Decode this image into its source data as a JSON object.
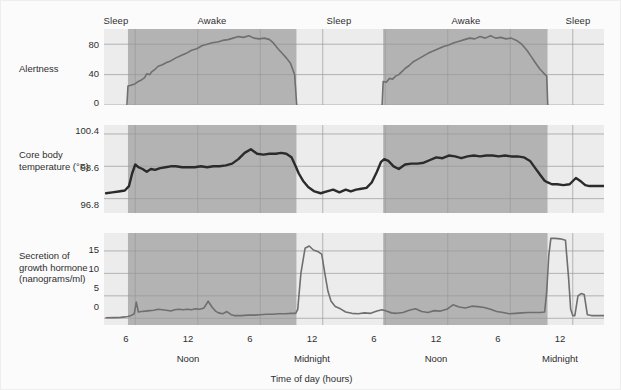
{
  "figure": {
    "background_color": "#fbfbfb",
    "border_color": "#eeeeee",
    "awake_band_color": "#b3b3b3",
    "sleep_band_color": "#ececec",
    "grid_color": "#9a9a9a",
    "line_color": "#6f6f6f",
    "temp_line_color": "#2b2b2b",
    "text_color": "#2f2f2f"
  },
  "band_labels": [
    {
      "text": "Sleep",
      "center_x": 115
    },
    {
      "text": "Awake",
      "center_x": 211
    },
    {
      "text": "Awake",
      "center_x": 465
    },
    {
      "text": "Sleep",
      "center_x": 338
    },
    {
      "text": "Sleep",
      "center_x": 577
    }
  ],
  "axis": {
    "x_title": "Time of day (hours)",
    "x_ticks": [
      {
        "label": "6",
        "x": 125
      },
      {
        "label": "12",
        "x": 187
      },
      {
        "label": "6",
        "x": 249
      },
      {
        "label": "12",
        "x": 311
      },
      {
        "label": "6",
        "x": 373
      },
      {
        "label": "12",
        "x": 435
      },
      {
        "label": "6",
        "x": 497
      },
      {
        "label": "12",
        "x": 559
      }
    ],
    "x_sublabels": [
      {
        "label": "Noon",
        "x": 187
      },
      {
        "label": "Midnight",
        "x": 311
      },
      {
        "label": "Noon",
        "x": 435
      },
      {
        "label": "Midnight",
        "x": 559
      }
    ]
  },
  "panels": [
    {
      "id": "alertness",
      "label": "Alertness",
      "label_lines": [
        "Alertness"
      ],
      "y_ticks": [
        "80",
        "40",
        "0"
      ]
    },
    {
      "id": "core-body-temperature",
      "label": "Core body temperature (°F)",
      "label_lines": [
        "Core body",
        "temperature (°F)"
      ],
      "y_ticks": [
        "100.4",
        "98.6",
        "96.8"
      ]
    },
    {
      "id": "growth-hormone",
      "label": "Secretion of growth hormone (nanograms/ml)",
      "label_lines": [
        "Secretion of",
        "growth hormone",
        "(nanograms/ml)"
      ],
      "y_ticks": [
        "15",
        "10",
        "5",
        "0"
      ]
    }
  ],
  "chart_data": {
    "type": "line",
    "title": "",
    "xlabel": "Time of day (hours)",
    "grid": true,
    "legend": "none",
    "x_axis": {
      "unit": "hours from start",
      "range": [
        3,
        51
      ],
      "tick_values": [
        6,
        12,
        18,
        24,
        30,
        36,
        42,
        48
      ],
      "tick_labels": [
        "6",
        "12",
        "6",
        "12",
        "6",
        "12",
        "6",
        "12"
      ],
      "tick_sublabels": [
        "",
        "Noon",
        "",
        "Midnight",
        "",
        "Noon",
        "",
        "Midnight"
      ]
    },
    "shaded_regions": [
      {
        "state": "Sleep",
        "x_start": 3,
        "x_end": 5.3,
        "color": "#ececec"
      },
      {
        "state": "Awake",
        "x_start": 5.3,
        "x_end": 21.5,
        "color": "#b3b3b3"
      },
      {
        "state": "Sleep",
        "x_start": 21.5,
        "x_end": 29.8,
        "color": "#ececec"
      },
      {
        "state": "Awake",
        "x_start": 29.8,
        "x_end": 45.6,
        "color": "#b3b3b3"
      },
      {
        "state": "Sleep",
        "x_start": 45.6,
        "x_end": 51,
        "color": "#ececec"
      }
    ],
    "panels": [
      {
        "id": "alertness",
        "ylabel": "Alertness",
        "ylim": [
          0,
          100
        ],
        "ytick_values": [
          0,
          40,
          80
        ],
        "ytick_labels": [
          "0",
          "40",
          "80"
        ],
        "line_color": "#6f6f6f",
        "series": [
          {
            "name": "Alertness",
            "segments": [
              {
                "x": [
                  5.2,
                  5.3,
                  5.6,
                  6.0,
                  6.3,
                  6.6,
                  6.9,
                  7.1,
                  7.4,
                  7.6,
                  7.9,
                  8.2,
                  8.6,
                  9.0,
                  9.4,
                  9.9,
                  10.4,
                  10.9,
                  11.4,
                  11.9,
                  12.4,
                  12.9,
                  13.4,
                  13.9,
                  14.4,
                  14.9,
                  15.4,
                  15.9,
                  16.4,
                  16.9,
                  17.4,
                  17.9,
                  18.4,
                  18.9,
                  19.3,
                  19.7,
                  20.1,
                  20.5,
                  20.9,
                  21.3,
                  21.5
                ],
                "y": [
                  0,
                  25,
                  26,
                  28,
                  31,
                  33,
                  36,
                  41,
                  40,
                  44,
                  47,
                  51,
                  53,
                  56,
                  58,
                  62,
                  65,
                  68,
                  72,
                  74,
                  78,
                  80,
                  82,
                  83,
                  85,
                  86,
                  88,
                  90,
                  89,
                  91,
                  88,
                  87,
                  88,
                  86,
                  81,
                  74,
                  68,
                  62,
                  55,
                  40,
                  0
                ]
              }
            ]
          },
          {
            "name": "Alertness (day 2)",
            "segments": [
              {
                "x": [
                  29.7,
                  29.8,
                  30.1,
                  30.4,
                  30.7,
                  31.0,
                  31.3,
                  31.6,
                  31.9,
                  32.3,
                  32.7,
                  33.1,
                  33.6,
                  34.1,
                  34.6,
                  35.1,
                  35.6,
                  36.1,
                  36.6,
                  37.1,
                  37.6,
                  38.1,
                  38.6,
                  39.1,
                  39.6,
                  40.1,
                  40.6,
                  41.1,
                  41.6,
                  42.1,
                  42.6,
                  43.1,
                  43.6,
                  44.0,
                  44.4,
                  44.8,
                  45.2,
                  45.5,
                  45.6
                ],
                "y": [
                  0,
                  31,
                  30,
                  35,
                  34,
                  38,
                  40,
                  44,
                  48,
                  52,
                  57,
                  60,
                  64,
                  68,
                  71,
                  74,
                  77,
                  79,
                  82,
                  84,
                  86,
                  88,
                  87,
                  90,
                  88,
                  91,
                  88,
                  89,
                  87,
                  88,
                  85,
                  80,
                  72,
                  64,
                  56,
                  48,
                  42,
                  38,
                  0
                ]
              }
            ]
          }
        ]
      },
      {
        "id": "core-body-temperature",
        "ylabel": "Core body temperature (°F)",
        "ylim": [
          96.0,
          100.9
        ],
        "ytick_values": [
          96.8,
          98.6,
          100.4
        ],
        "ytick_labels": [
          "96.8",
          "98.6",
          "100.4"
        ],
        "line_color": "#2b2b2b",
        "series": [
          {
            "name": "Core body temperature",
            "segments": [
              {
                "x": [
                  3.2,
                  3.8,
                  4.4,
                  5.0,
                  5.4,
                  5.7,
                  6.0,
                  6.3,
                  6.7,
                  7.1,
                  7.5,
                  7.9,
                  8.4,
                  8.9,
                  9.4,
                  9.9,
                  10.5,
                  11.1,
                  11.7,
                  12.3,
                  12.9,
                  13.5,
                  14.1,
                  14.7,
                  15.3,
                  15.9,
                  16.5,
                  17.1,
                  17.7,
                  18.3,
                  18.9,
                  19.5,
                  20.0,
                  20.5,
                  21.0,
                  21.4,
                  21.7,
                  22.1,
                  22.6,
                  23.2,
                  23.8,
                  24.4,
                  25.0,
                  25.6,
                  26.2,
                  26.7,
                  27.2,
                  27.7,
                  28.2,
                  28.7,
                  29.2,
                  29.6,
                  29.9,
                  30.3,
                  30.8,
                  31.3,
                  31.9,
                  32.5,
                  33.1,
                  33.7,
                  34.3,
                  34.9,
                  35.5,
                  36.1,
                  36.7,
                  37.3,
                  37.9,
                  38.5,
                  39.1,
                  39.7,
                  40.3,
                  40.9,
                  41.5,
                  42.1,
                  42.7,
                  43.3,
                  43.9,
                  44.4,
                  44.9,
                  45.3,
                  45.6,
                  46.0,
                  46.5,
                  47.1,
                  47.7,
                  48.3,
                  48.8,
                  49.2,
                  49.6,
                  50.1,
                  50.6,
                  51.0
                ],
                "y": [
                  97.1,
                  97.15,
                  97.2,
                  97.25,
                  97.5,
                  98.2,
                  98.7,
                  98.55,
                  98.45,
                  98.3,
                  98.45,
                  98.4,
                  98.5,
                  98.55,
                  98.6,
                  98.6,
                  98.55,
                  98.55,
                  98.55,
                  98.6,
                  98.55,
                  98.6,
                  98.6,
                  98.65,
                  98.75,
                  99.0,
                  99.35,
                  99.55,
                  99.3,
                  99.25,
                  99.3,
                  99.3,
                  99.35,
                  99.3,
                  99.1,
                  98.6,
                  98.2,
                  97.8,
                  97.45,
                  97.2,
                  97.1,
                  97.2,
                  97.3,
                  97.15,
                  97.3,
                  97.2,
                  97.3,
                  97.35,
                  97.4,
                  97.7,
                  98.3,
                  98.85,
                  99.0,
                  98.9,
                  98.6,
                  98.45,
                  98.7,
                  98.75,
                  98.75,
                  98.8,
                  98.95,
                  99.1,
                  99.05,
                  99.2,
                  99.15,
                  99.05,
                  99.15,
                  99.2,
                  99.15,
                  99.2,
                  99.2,
                  99.15,
                  99.2,
                  99.15,
                  99.15,
                  99.1,
                  98.9,
                  98.5,
                  98.1,
                  97.8,
                  97.7,
                  97.6,
                  97.6,
                  97.55,
                  97.6,
                  97.95,
                  97.75,
                  97.55,
                  97.5,
                  97.5,
                  97.5,
                  97.5
                ]
              }
            ]
          }
        ]
      },
      {
        "id": "growth-hormone",
        "ylabel": "Secretion of growth hormone (nanograms/ml)",
        "ylim": [
          -1.5,
          19
        ],
        "ytick_values": [
          0,
          5,
          10,
          15
        ],
        "ytick_labels": [
          "0",
          "5",
          "10",
          "15"
        ],
        "line_color": "#6f6f6f",
        "series": [
          {
            "name": "Growth hormone secretion",
            "segments": [
              {
                "x": [
                  3.2,
                  4.0,
                  4.6,
                  5.0,
                  5.3,
                  5.6,
                  5.9,
                  6.1,
                  6.3,
                  6.6,
                  7.0,
                  7.4,
                  7.8,
                  8.2,
                  8.6,
                  9.0,
                  9.4,
                  9.8,
                  10.2,
                  10.6,
                  11.0,
                  11.4,
                  11.8,
                  12.2,
                  12.6,
                  13.0,
                  13.4,
                  13.7,
                  14.0,
                  14.4,
                  14.8,
                  15.2,
                  15.5,
                  15.8,
                  16.2,
                  16.8,
                  17.4,
                  18.0,
                  18.6,
                  19.2,
                  19.8,
                  20.4,
                  21.0,
                  21.4,
                  21.6,
                  21.9,
                  22.3,
                  22.7,
                  23.1,
                  23.5,
                  23.9,
                  24.2,
                  24.5,
                  24.8,
                  25.2,
                  25.7,
                  26.2,
                  26.8,
                  27.4,
                  28.0,
                  28.6,
                  29.2,
                  29.7,
                  30.1,
                  30.6,
                  31.1,
                  31.7,
                  32.3,
                  32.9,
                  33.5,
                  34.1,
                  34.7,
                  35.3,
                  35.9,
                  36.5,
                  37.1,
                  37.7,
                  38.3,
                  38.9,
                  39.5,
                  40.1,
                  40.7,
                  41.3,
                  41.9,
                  42.5,
                  43.1,
                  43.7,
                  44.3,
                  44.9,
                  45.3,
                  45.5,
                  45.7,
                  45.9,
                  46.3,
                  46.8,
                  47.3,
                  47.6,
                  47.8,
                  48.0,
                  48.2,
                  48.5,
                  48.8,
                  49.1,
                  49.4,
                  49.8,
                  50.3,
                  50.8,
                  51.0
                ],
                "y": [
                  0.1,
                  0.15,
                  0.2,
                  0.3,
                  0.4,
                  0.6,
                  1.0,
                  3.6,
                  1.4,
                  1.5,
                  1.6,
                  1.7,
                  1.8,
                  2.0,
                  1.9,
                  1.8,
                  1.6,
                  1.9,
                  2.0,
                  1.9,
                  2.0,
                  1.9,
                  2.1,
                  2.0,
                  2.3,
                  3.8,
                  2.4,
                  1.6,
                  1.2,
                  1.0,
                  1.5,
                  0.8,
                  0.6,
                  0.6,
                  0.6,
                  0.7,
                  0.7,
                  0.8,
                  0.9,
                  0.9,
                  1.0,
                  1.0,
                  1.1,
                  1.1,
                  2.0,
                  10.0,
                  15.6,
                  16.1,
                  15.2,
                  14.9,
                  14.3,
                  10.0,
                  6.0,
                  3.8,
                  2.6,
                  2.1,
                  1.4,
                  1.1,
                  1.0,
                  1.2,
                  1.1,
                  1.6,
                  1.9,
                  1.6,
                  1.2,
                  1.1,
                  1.3,
                  1.8,
                  2.1,
                  1.5,
                  1.3,
                  1.7,
                  1.6,
                  2.0,
                  3.0,
                  2.5,
                  2.3,
                  2.7,
                  2.6,
                  2.4,
                  2.0,
                  1.5,
                  1.3,
                  1.0,
                  1.1,
                  1.2,
                  1.3,
                  1.3,
                  1.3,
                  1.4,
                  6.0,
                  14.0,
                  17.8,
                  17.8,
                  17.7,
                  17.4,
                  9.0,
                  2.0,
                  0.6,
                  0.6,
                  5.0,
                  5.5,
                  5.3,
                  0.8,
                  0.6,
                  0.6,
                  0.6,
                  0.6
                ]
              }
            ]
          }
        ]
      }
    ]
  }
}
